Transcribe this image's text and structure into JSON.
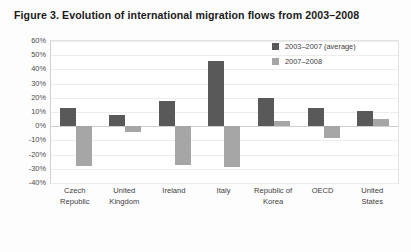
{
  "figure": {
    "title": "Figure 3.  Evolution of international migration flows from 2003–2008"
  },
  "legend": {
    "position": "top-right",
    "entries": [
      {
        "label": "2003–2007  (average)",
        "color": "#595959"
      },
      {
        "label": "2007–2008",
        "color": "#a6a6a6"
      }
    ]
  },
  "axis": {
    "yticks": [
      "60%",
      "50%",
      "40%",
      "30%",
      "20%",
      "10%",
      "0%",
      "-10%",
      "-20%",
      "-30%",
      "-40%"
    ]
  },
  "chart_data": {
    "type": "bar",
    "title": "Figure 3.  Evolution of international migration flows from 2003–2008",
    "xlabel": "",
    "ylabel": "",
    "ylim": [
      -40,
      60
    ],
    "ytick_values": [
      60,
      50,
      40,
      30,
      20,
      10,
      0,
      -10,
      -20,
      -30,
      -40
    ],
    "ytick_labels": [
      "60%",
      "50%",
      "40%",
      "30%",
      "20%",
      "10%",
      "0%",
      "-10%",
      "-20%",
      "-30%",
      "-40%"
    ],
    "grid": true,
    "legend_position": "top-right",
    "units": "percent",
    "categories": [
      "Czech Republic",
      "United Kingdom",
      "Ireland",
      "Italy",
      "Republic of Korea",
      "OECD",
      "United States"
    ],
    "category_lines": [
      [
        "Czech",
        "Republic"
      ],
      [
        "United",
        "Kingdom"
      ],
      [
        "Ireland"
      ],
      [
        "Italy"
      ],
      [
        "Republic of",
        "Korea"
      ],
      [
        "OECD"
      ],
      [
        "United",
        "States"
      ]
    ],
    "series": [
      {
        "name": "2003–2007  (average)",
        "color": "#595959",
        "values": [
          13,
          8,
          18,
          46,
          20,
          13,
          11
        ]
      },
      {
        "name": "2007–2008",
        "color": "#a6a6a6",
        "values": [
          -28,
          -4,
          -27,
          -29,
          4,
          -8,
          5
        ]
      }
    ]
  }
}
